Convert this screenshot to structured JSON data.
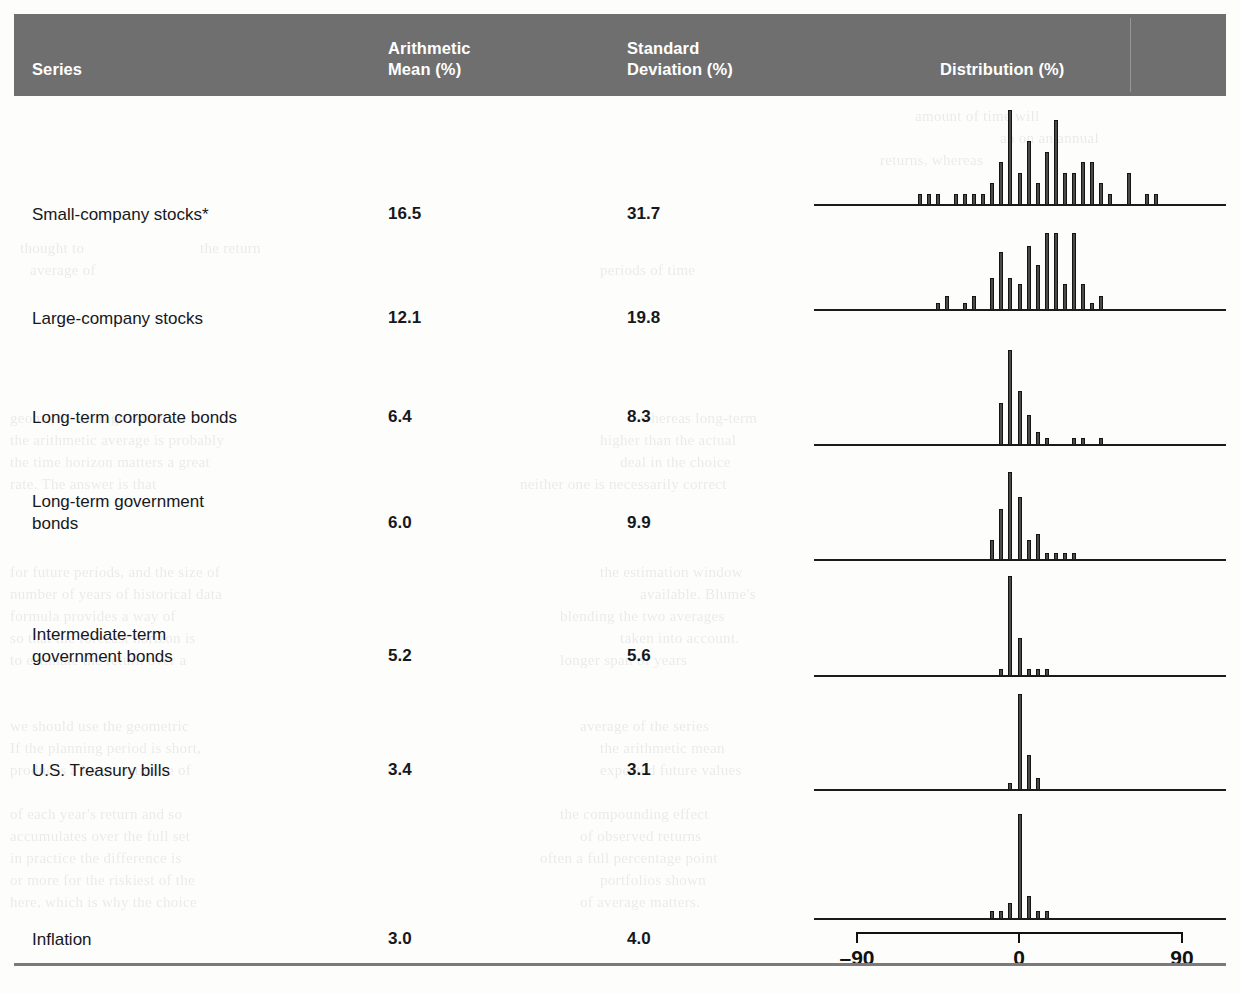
{
  "header": {
    "col_series": "Series",
    "col_mean": "Arithmetic\nMean (%)",
    "col_mean_line1": "Arithmetic",
    "col_mean_line2": "Mean (%)",
    "col_sd_line1": "Standard",
    "col_sd_line2": "Deviation (%)",
    "col_distribution": "Distribution (%)",
    "background_color": "#6f6f6f",
    "text_color": "#ffffff"
  },
  "axis": {
    "left_label": "–90",
    "center_label": "0",
    "right_label": "90",
    "min": -90,
    "center": 0,
    "max": 90
  },
  "rows": [
    {
      "label": "Small-company stocks*",
      "mean": "16.5",
      "std_dev": "31.7"
    },
    {
      "label": "Large-company stocks",
      "mean": "12.1",
      "std_dev": "19.8"
    },
    {
      "label": "Long-term corporate bonds",
      "mean": "6.4",
      "std_dev": "8.3"
    },
    {
      "label": "Long-term government\nbonds",
      "mean": "6.0",
      "std_dev": "9.9"
    },
    {
      "label": "Intermediate-term\ngovernment bonds",
      "mean": "5.2",
      "std_dev": "5.6"
    },
    {
      "label": "U.S. Treasury bills",
      "mean": "3.4",
      "std_dev": "3.1"
    },
    {
      "label": "Inflation",
      "mean": "3.0",
      "std_dev": "4.0"
    }
  ],
  "chart_data": {
    "type": "bar",
    "title": "Distribution (%)",
    "xlabel": "Annual return (%)",
    "ylabel": "Frequency (number of years)",
    "xlim": [
      -90,
      90
    ],
    "grid": false,
    "legend": "none",
    "note": "Seven stacked histograms of annual total returns; each bar is a bin of the return distribution, x axis shared from -90% to +90% with 0 centered.",
    "bin_width": 5,
    "series": [
      {
        "name": "Small-company stocks*",
        "mean": 16.5,
        "std_dev": 31.7,
        "bins": [
          -55,
          -50,
          -45,
          -35,
          -30,
          -25,
          -20,
          -15,
          -10,
          -5,
          0,
          5,
          10,
          15,
          20,
          25,
          30,
          35,
          40,
          45,
          50,
          60,
          70,
          75
        ],
        "counts": [
          1,
          1,
          1,
          1,
          1,
          1,
          1,
          2,
          4,
          9,
          3,
          6,
          2,
          5,
          8,
          3,
          3,
          4,
          4,
          2,
          1,
          3,
          1,
          1
        ]
      },
      {
        "name": "Large-company stocks",
        "mean": 12.1,
        "std_dev": 19.8,
        "bins": [
          -45,
          -40,
          -30,
          -25,
          -15,
          -10,
          -5,
          0,
          5,
          10,
          15,
          20,
          25,
          30,
          35,
          40,
          45
        ],
        "counts": [
          1,
          2,
          1,
          2,
          5,
          9,
          5,
          4,
          10,
          7,
          12,
          12,
          4,
          12,
          4,
          1,
          2
        ]
      },
      {
        "name": "Long-term corporate bonds",
        "mean": 6.4,
        "std_dev": 8.3,
        "bins": [
          -10,
          -5,
          0,
          5,
          10,
          15,
          30,
          35,
          45
        ],
        "counts": [
          7,
          16,
          9,
          5,
          2,
          1,
          1,
          1,
          1
        ]
      },
      {
        "name": "Long-term government bonds",
        "mean": 6.0,
        "std_dev": 9.9,
        "bins": [
          -15,
          -10,
          -5,
          0,
          5,
          10,
          15,
          20,
          25,
          30
        ],
        "counts": [
          3,
          8,
          14,
          10,
          3,
          4,
          1,
          1,
          1,
          1
        ]
      },
      {
        "name": "Intermediate-term government bonds",
        "mean": 5.2,
        "std_dev": 5.6,
        "bins": [
          -10,
          -5,
          0,
          5,
          10,
          15
        ],
        "counts": [
          1,
          16,
          6,
          1,
          1,
          1
        ]
      },
      {
        "name": "U.S. Treasury bills",
        "mean": 3.4,
        "std_dev": 3.1,
        "bins": [
          -5,
          0,
          5,
          10
        ],
        "counts": [
          1,
          17,
          6,
          2
        ]
      },
      {
        "name": "Inflation",
        "mean": 3.0,
        "std_dev": 4.0,
        "bins": [
          -15,
          -10,
          -5,
          0,
          5,
          10,
          15
        ],
        "counts": [
          1,
          1,
          2,
          14,
          3,
          1,
          1
        ]
      }
    ]
  }
}
